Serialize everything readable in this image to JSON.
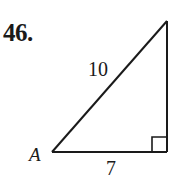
{
  "problem": {
    "number": "46."
  },
  "figure": {
    "type": "right-triangle",
    "vertex_label": "A",
    "hypotenuse_label": "10",
    "base_label": "7",
    "right_angle_marker": true,
    "stroke_color": "#1a1a1a"
  }
}
